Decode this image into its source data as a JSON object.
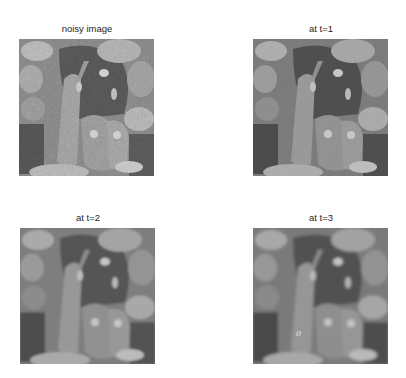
{
  "figure": {
    "panels": [
      {
        "title": "noisy image",
        "x": 19,
        "y": 39,
        "w": 135,
        "h": 137,
        "blur": 0,
        "noise": 0.55
      },
      {
        "title": "at t=1",
        "x": 253,
        "y": 39,
        "w": 135,
        "h": 137,
        "blur": 0.6,
        "noise": 0.25
      },
      {
        "title": "at t=2",
        "x": 20,
        "y": 228,
        "w": 135,
        "h": 136,
        "blur": 1.1,
        "noise": 0.1
      },
      {
        "title": "at t=3",
        "x": 253,
        "y": 228,
        "w": 135,
        "h": 136,
        "blur": 1.4,
        "noise": 0.05
      }
    ],
    "annotation": {
      "text": "0",
      "panel": 3
    }
  }
}
